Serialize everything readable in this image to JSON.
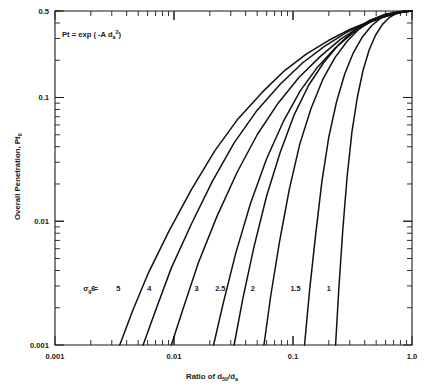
{
  "figure": {
    "annotation": "Pt = exp ( -A d",
    "annotation_sub": "a",
    "annotation_sup": "2",
    "annotation_tail": ")",
    "annotation_full": "Pt = exp ( -A da2 )",
    "background_color": "#ffffff",
    "line_color": "#111111"
  },
  "axes": {
    "x": {
      "title_prefix": "Ratio of d",
      "title_sub1": "50",
      "title_mid": "/d",
      "title_sub2": "a",
      "title_full": "Ratio of d50/da",
      "scale": "log",
      "min": 0.001,
      "max": 1.0,
      "tick_labels": [
        "0.001",
        "0.01",
        "0.1",
        "1.0"
      ],
      "tick_values": [
        0.001,
        0.01,
        0.1,
        1.0
      ]
    },
    "y": {
      "title_prefix": "Overall Penetration, Pt",
      "title_sub": "0",
      "title_full": "Overall Penetration, Pt0",
      "scale": "log",
      "min": 0.001,
      "max": 0.5,
      "tick_labels": [
        "0.001",
        "0.01",
        "0.1",
        "0.5"
      ],
      "tick_values": [
        0.001,
        0.01,
        0.1,
        0.5
      ]
    }
  },
  "legend": {
    "symbol": "σ",
    "symbol_sub": "g",
    "equals": "=",
    "label_full": "σg ="
  },
  "chart_data": {
    "type": "line",
    "title": "",
    "subtitle": "",
    "xlabel": "Ratio of d50/da",
    "ylabel": "Overall Penetration, Pt0",
    "xscale": "log",
    "yscale": "log",
    "xlim": [
      0.001,
      1.0
    ],
    "ylim": [
      0.001,
      0.5
    ],
    "grid": false,
    "legend_position": "inside-bottom",
    "annotations": [
      "Pt = exp ( -A da2 )"
    ],
    "legend_title": "σg =",
    "series": [
      {
        "name": "6",
        "sigma_g": 6,
        "label_x": 0.0021,
        "x": [
          0.0035,
          0.0045,
          0.006,
          0.009,
          0.014,
          0.022,
          0.034,
          0.055,
          0.085,
          0.13,
          0.2,
          0.3,
          0.45,
          0.65,
          0.85,
          1.0
        ],
        "y": [
          0.001,
          0.0019,
          0.0037,
          0.0082,
          0.018,
          0.037,
          0.066,
          0.11,
          0.165,
          0.225,
          0.29,
          0.355,
          0.415,
          0.462,
          0.49,
          0.5
        ]
      },
      {
        "name": "5",
        "sigma_g": 5,
        "label_x": 0.0034,
        "x": [
          0.0055,
          0.007,
          0.0095,
          0.014,
          0.021,
          0.032,
          0.05,
          0.078,
          0.12,
          0.185,
          0.28,
          0.42,
          0.6,
          0.8,
          1.0
        ],
        "y": [
          0.001,
          0.0019,
          0.0042,
          0.0095,
          0.021,
          0.043,
          0.079,
          0.128,
          0.19,
          0.26,
          0.335,
          0.405,
          0.458,
          0.488,
          0.5
        ]
      },
      {
        "name": "4",
        "sigma_g": 4,
        "label_x": 0.0062,
        "x": [
          0.0095,
          0.012,
          0.016,
          0.023,
          0.034,
          0.05,
          0.075,
          0.112,
          0.17,
          0.25,
          0.37,
          0.54,
          0.75,
          1.0
        ],
        "y": [
          0.001,
          0.002,
          0.0046,
          0.011,
          0.025,
          0.05,
          0.09,
          0.145,
          0.215,
          0.295,
          0.375,
          0.44,
          0.482,
          0.5
        ]
      },
      {
        "name": "3",
        "sigma_g": 3,
        "label_x": 0.0155,
        "x": [
          0.0215,
          0.026,
          0.033,
          0.044,
          0.06,
          0.083,
          0.115,
          0.16,
          0.225,
          0.315,
          0.44,
          0.62,
          0.82,
          1.0
        ],
        "y": [
          0.001,
          0.0022,
          0.0055,
          0.014,
          0.032,
          0.064,
          0.113,
          0.175,
          0.25,
          0.33,
          0.405,
          0.46,
          0.49,
          0.5
        ]
      },
      {
        "name": "2.5",
        "sigma_g": 2.5,
        "label_x": 0.0245,
        "x": [
          0.032,
          0.038,
          0.047,
          0.06,
          0.078,
          0.102,
          0.135,
          0.18,
          0.24,
          0.32,
          0.43,
          0.58,
          0.78,
          1.0
        ],
        "y": [
          0.001,
          0.0024,
          0.0062,
          0.016,
          0.036,
          0.072,
          0.125,
          0.19,
          0.265,
          0.345,
          0.415,
          0.465,
          0.492,
          0.5
        ]
      },
      {
        "name": "2",
        "sigma_g": 2,
        "label_x": 0.046,
        "x": [
          0.057,
          0.065,
          0.077,
          0.093,
          0.114,
          0.142,
          0.178,
          0.225,
          0.285,
          0.36,
          0.46,
          0.59,
          0.77,
          1.0
        ],
        "y": [
          0.001,
          0.0025,
          0.0068,
          0.018,
          0.042,
          0.082,
          0.14,
          0.21,
          0.285,
          0.36,
          0.425,
          0.47,
          0.494,
          0.5
        ]
      },
      {
        "name": "1.5",
        "sigma_g": 1.5,
        "label_x": 0.105,
        "x": [
          0.125,
          0.138,
          0.155,
          0.175,
          0.2,
          0.232,
          0.272,
          0.32,
          0.38,
          0.455,
          0.545,
          0.66,
          0.81,
          1.0
        ],
        "y": [
          0.001,
          0.0028,
          0.0078,
          0.021,
          0.048,
          0.092,
          0.155,
          0.228,
          0.305,
          0.378,
          0.438,
          0.476,
          0.496,
          0.5
        ]
      },
      {
        "name": "1",
        "sigma_g": 1,
        "label_x": 0.2,
        "x": [
          0.228,
          0.243,
          0.262,
          0.285,
          0.313,
          0.347,
          0.388,
          0.437,
          0.495,
          0.565,
          0.648,
          0.745,
          0.865,
          1.0
        ],
        "y": [
          0.001,
          0.0029,
          0.0085,
          0.023,
          0.053,
          0.1,
          0.166,
          0.243,
          0.32,
          0.39,
          0.445,
          0.48,
          0.497,
          0.5
        ]
      }
    ]
  }
}
